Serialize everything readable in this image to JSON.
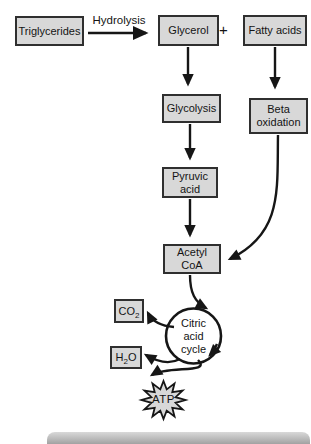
{
  "diagram": {
    "colors": {
      "background": "#ffffff",
      "box_fill": "#d8d8d8",
      "box_border": "#2f2f2f",
      "arrow": "#161616",
      "footer_bar": "#a2a2a2"
    },
    "nodes": {
      "triglycerides": {
        "label": "Triglycerides"
      },
      "glycerol": {
        "label": "Glycerol"
      },
      "plus_sign": {
        "label": "+"
      },
      "fatty_acids": {
        "label": "Fatty acids"
      },
      "glycolysis": {
        "label": "Glycolysis"
      },
      "beta_oxidation": {
        "label": "Beta\noxidation"
      },
      "pyruvic_acid": {
        "label": "Pyruvic\nacid"
      },
      "acetyl_coa": {
        "label": "Acetyl\nCoA"
      },
      "co2": {
        "pre": "CO",
        "sub": "2",
        "post": ""
      },
      "h2o": {
        "pre": "H",
        "sub": "2",
        "post": "O"
      },
      "citric_acid_cycle": {
        "label": "Citric\nacid\ncycle"
      },
      "atp": {
        "label": "ATP"
      }
    },
    "edge_labels": {
      "hydrolysis": "Hydrolysis"
    },
    "edges": [
      {
        "from": "Triglycerides",
        "to": "Glycerol",
        "label": "Hydrolysis"
      },
      {
        "from": "Glycerol",
        "to": "Glycolysis",
        "label": ""
      },
      {
        "from": "Fatty acids",
        "to": "Beta oxidation",
        "label": ""
      },
      {
        "from": "Glycolysis",
        "to": "Pyruvic acid",
        "label": ""
      },
      {
        "from": "Pyruvic acid",
        "to": "Acetyl CoA",
        "label": ""
      },
      {
        "from": "Beta oxidation",
        "to": "Acetyl CoA",
        "label": ""
      },
      {
        "from": "Acetyl CoA",
        "to": "Citric acid cycle",
        "label": ""
      },
      {
        "from": "Citric acid cycle",
        "to": "CO2",
        "label": ""
      },
      {
        "from": "Citric acid cycle",
        "to": "H2O",
        "label": ""
      },
      {
        "from": "Citric acid cycle",
        "to": "ATP",
        "label": ""
      }
    ]
  }
}
